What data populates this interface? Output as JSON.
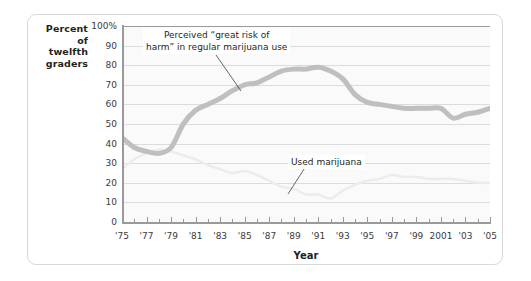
{
  "axis_title_y": "Percent\nof\ntwelfth\ngraders",
  "axis_title_x": "Year",
  "annotations": {
    "risk": "Perceived “great risk of\nharm” in regular marijuana use",
    "use": "Used marijuana"
  },
  "colors": {
    "risk_line": "#bfbfbf",
    "use_line": "#ececec",
    "grid": "#dcdcdc",
    "axis": "#9a9a9a",
    "text": "#231f20",
    "plot_bg": "#fafafa",
    "frame": "#d8d8d8"
  },
  "chart_data": {
    "type": "line",
    "title": "",
    "subtitle": "",
    "xlabel": "Year",
    "ylabel": "Percent of twelfth graders",
    "xlim": [
      1975,
      2005
    ],
    "ylim": [
      0,
      100
    ],
    "grid": true,
    "legend": "annotations-inline",
    "ytick_labels": [
      "100%",
      "90",
      "80",
      "70",
      "60",
      "50",
      "40",
      "30",
      "20",
      "10",
      "0"
    ],
    "ytick_values": [
      100,
      90,
      80,
      70,
      60,
      50,
      40,
      30,
      20,
      10,
      0
    ],
    "xtick_labels": [
      "'75",
      "'77",
      "'79",
      "'81",
      "'83",
      "'85",
      "'87",
      "'89",
      "'91",
      "'93",
      "'95",
      "'97",
      "'99",
      "2001",
      "'03",
      "'05"
    ],
    "xtick_values": [
      1975,
      1977,
      1979,
      1981,
      1983,
      1985,
      1987,
      1989,
      1991,
      1993,
      1995,
      1997,
      1999,
      2001,
      2003,
      2005
    ],
    "x": [
      1975,
      1976,
      1977,
      1978,
      1979,
      1980,
      1981,
      1982,
      1983,
      1984,
      1985,
      1986,
      1987,
      1988,
      1989,
      1990,
      1991,
      1992,
      1993,
      1994,
      1995,
      1996,
      1997,
      1998,
      1999,
      2000,
      2001,
      2002,
      2003,
      2004,
      2005
    ],
    "series": [
      {
        "name": "Perceived “great risk of harm” in regular marijuana use",
        "color": "#bfbfbf",
        "width": 5,
        "values": [
          43,
          38,
          36,
          35,
          38,
          50,
          57,
          60,
          63,
          67,
          70,
          71,
          74,
          77,
          78,
          78,
          79,
          77,
          73,
          65,
          61,
          60,
          59,
          58,
          58,
          58,
          58,
          53,
          55,
          56,
          58
        ]
      },
      {
        "name": "Used marijuana",
        "color": "#ececec",
        "width": 2.5,
        "values": [
          27,
          32,
          35,
          37,
          36,
          34,
          32,
          29,
          27,
          25,
          26,
          24,
          21,
          18,
          17,
          14,
          14,
          12,
          16,
          19,
          21,
          22,
          24,
          23,
          23,
          22,
          22,
          22,
          21,
          20,
          20
        ]
      }
    ]
  }
}
